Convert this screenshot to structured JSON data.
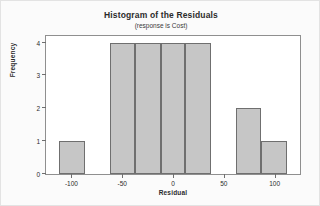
{
  "chart_data": {
    "type": "bar",
    "title": "Histogram of the Residuals",
    "subtitle": "(response is Cost)",
    "xlabel": "Residual",
    "ylabel": "Frequency",
    "xlim": [
      -125,
      125
    ],
    "ylim": [
      0,
      4.2
    ],
    "grid": false,
    "legend": null,
    "bin_width": 25,
    "xticks": [
      -100,
      -50,
      0,
      50,
      100
    ],
    "xtick_labels": [
      "-100",
      "-50",
      "0",
      "50",
      "100"
    ],
    "yticks": [
      0,
      1,
      2,
      3,
      4
    ],
    "ytick_labels": [
      "0",
      "1",
      "2",
      "3",
      "4"
    ],
    "bars": [
      {
        "left": -112,
        "right": -87,
        "value": 1
      },
      {
        "left": -62,
        "right": -37,
        "value": 4
      },
      {
        "left": -37,
        "right": -12,
        "value": 4
      },
      {
        "left": -12,
        "right": 12,
        "value": 4
      },
      {
        "left": 12,
        "right": 37,
        "value": 4
      },
      {
        "left": 62,
        "right": 87,
        "value": 2
      },
      {
        "left": 87,
        "right": 112,
        "value": 1
      }
    ],
    "categories": [
      "-100",
      "-50",
      "-25",
      "0",
      "25",
      "75",
      "100"
    ],
    "values": [
      1,
      4,
      4,
      4,
      4,
      2,
      1
    ],
    "colors": {
      "bar_fill": "#c6c6c6",
      "bar_edge": "#6f6f6f",
      "frame": "#8f8f8f",
      "text": "#2b2b2b",
      "background": "#fbfbfb",
      "plot_background": "#ffffff"
    }
  }
}
